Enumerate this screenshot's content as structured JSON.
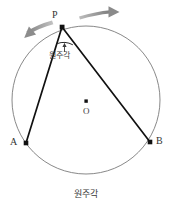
{
  "figure": {
    "caption": "원주각",
    "caption_position": "bottom-center",
    "background_color": "#ffffff",
    "width": 171,
    "height": 212
  },
  "circle": {
    "name": "circle-o",
    "center": {
      "x": 86,
      "y": 100
    },
    "radius": 74,
    "stroke_color": "#7a7a7a",
    "stroke_width": 0.9,
    "fill": "none"
  },
  "points": [
    {
      "id": "P",
      "label": "P",
      "x": 62,
      "y": 27,
      "label_x": 52,
      "label_y": 12,
      "marker_color": "#111111",
      "marker_size": 2.6
    },
    {
      "id": "A",
      "label": "A",
      "x": 26,
      "y": 143,
      "label_x": 12,
      "label_y": 141,
      "marker_color": "#111111",
      "marker_size": 2.6
    },
    {
      "id": "B",
      "label": "B",
      "x": 150,
      "y": 142,
      "label_x": 155,
      "label_y": 140,
      "marker_color": "#111111",
      "marker_size": 2.6
    },
    {
      "id": "O",
      "label": "O",
      "x": 86,
      "y": 101,
      "label_x": 83,
      "label_y": 111,
      "marker_color": "#111111",
      "marker_size": 2.0
    }
  ],
  "chords": [
    {
      "name": "chord-pa",
      "from": "P",
      "to": "A",
      "stroke_color": "#111111",
      "stroke_width": 1.6
    },
    {
      "name": "chord-pb",
      "from": "P",
      "to": "B",
      "stroke_color": "#111111",
      "stroke_width": 1.6
    }
  ],
  "inscribed_angle": {
    "vertex": "P",
    "arc_marker_color": "#222222",
    "annotation_label": "원주각",
    "annotation_x": 51,
    "annotation_y": 55,
    "pointer_arrow": "up",
    "pointer_x": 64,
    "pointer_y_top": 40,
    "pointer_y_bottom": 51
  },
  "motion_arrows": [
    {
      "name": "arrow-right",
      "direction": "clockwise-right",
      "color": "#8e8e8e",
      "start": {
        "x": 79,
        "y": 14
      },
      "end": {
        "x": 116,
        "y": 10
      }
    },
    {
      "name": "arrow-left",
      "direction": "counterclockwise-left",
      "color": "#8e8e8e",
      "start": {
        "x": 50,
        "y": 22
      },
      "end": {
        "x": 16,
        "y": 36
      }
    }
  ],
  "colors": {
    "circle_stroke": "#7a7a7a",
    "chord_stroke": "#111111",
    "arrow_gray": "#8e8e8e",
    "text": "#333333",
    "background": "#ffffff"
  }
}
